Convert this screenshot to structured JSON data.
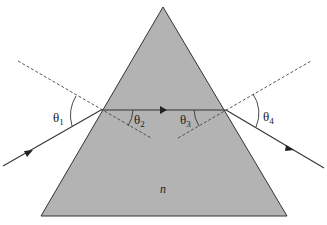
{
  "diagram": {
    "prism": {
      "apex": [
        163,
        7
      ],
      "base_left": [
        41,
        216
      ],
      "base_right": [
        287,
        216
      ],
      "fill": "#b3b3b3",
      "stroke": "#333333",
      "label": "n"
    },
    "ray": {
      "color": "#333333",
      "incoming": {
        "from": [
          3,
          166
        ],
        "to": [
          101,
          110
        ]
      },
      "inside": {
        "from": [
          101,
          110
        ],
        "to": [
          226,
          110
        ]
      },
      "outgoing": {
        "from": [
          226,
          110
        ],
        "to": [
          324,
          168
        ]
      }
    },
    "normals": {
      "left": {
        "from": [
          18,
          61
        ],
        "to": [
          151,
          138
        ]
      },
      "right": {
        "from": [
          178,
          138
        ],
        "to": [
          311,
          61
        ]
      }
    },
    "angles": {
      "theta1": {
        "label": "θ",
        "sub": "1"
      },
      "theta2": {
        "label": "θ",
        "sub": "2"
      },
      "theta3": {
        "label": "θ",
        "sub": "3"
      },
      "theta4": {
        "label": "θ",
        "sub": "4"
      }
    }
  }
}
